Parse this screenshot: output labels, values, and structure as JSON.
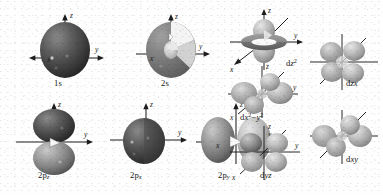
{
  "figure": {
    "background_color": "#fefefe",
    "ink_color": "#181818",
    "style": "grayscale shaded 3D renderings of hydrogen-like atomic orbitals with cartesian axis arrows"
  },
  "axis_labels": {
    "x": "x",
    "y": "y",
    "z": "z"
  },
  "orbitals": [
    {
      "id": "1s",
      "label_plain": "1s",
      "label_html": "1s",
      "shape": "sphere",
      "shade": "dark",
      "axes": [
        "z",
        "y",
        "x"
      ],
      "label_pos": "below"
    },
    {
      "id": "2s",
      "label_plain": "2s",
      "label_html": "2s",
      "shape": "cutaway-sphere-with-inner-node",
      "shade": "medium",
      "axes": [
        "z",
        "y",
        "x"
      ],
      "label_pos": "below"
    },
    {
      "id": "dz2",
      "label_plain": "dz2",
      "label_html": "d<span class='it'>z</span><span class='sup'>2</span>",
      "shape": "two-vertical-lobes-with-torus",
      "shade": "light",
      "axes": [
        "z",
        "y",
        "x"
      ],
      "label_pos": "right"
    },
    {
      "id": "2pz",
      "label_plain": "2pz",
      "label_html": "2p<span class='sub'>z</span>",
      "shape": "vertical-dumbbell",
      "shade": "dark",
      "axes": [
        "z",
        "y"
      ],
      "label_pos": "below"
    },
    {
      "id": "2px",
      "label_plain": "2px",
      "label_html": "2p<span class='sub'>x</span>",
      "shape": "dumbbell-along-viewer-axis",
      "shade": "dark",
      "axes": [
        "z",
        "y"
      ],
      "label_pos": "below"
    },
    {
      "id": "2py",
      "label_plain": "2py",
      "label_html": "2p<span class='sub'>y</span>",
      "shape": "horizontal-dumbbell",
      "shade": "medium",
      "axes": [
        "z",
        "y",
        "x"
      ],
      "label_pos": "below"
    },
    {
      "id": "dx2-y2",
      "label_plain": "dx2-y2",
      "label_html": "d<span class='it'>x</span><span class='sup'>2</span>&#8722;<span class='it'>y</span><span class='sup'>2</span>",
      "shape": "four-lobe-cloverleaf-on-axes",
      "shade": "light",
      "axes": [
        "z",
        "y",
        "x"
      ],
      "label_pos": "below"
    },
    {
      "id": "dyz",
      "label_plain": "dyz",
      "label_html": "d<span class='it'>yz</span>",
      "shape": "four-lobe-cloverleaf-between-axes",
      "shade": "medium",
      "axes": [
        "z",
        "y",
        "x"
      ],
      "label_pos": "below"
    },
    {
      "id": "dzx",
      "label_plain": "dzx",
      "label_html": "d<span class='it'>zx</span>",
      "shape": "four-lobe-cloverleaf-vertical",
      "shade": "light",
      "axes": [
        "z",
        "y",
        "x"
      ],
      "label_pos": "below-right"
    },
    {
      "id": "dxy",
      "label_plain": "dxy",
      "label_html": "d<span class='it'>xy</span>",
      "shape": "four-lobe-cloverleaf-horizontal",
      "shade": "light",
      "axes": [
        "z",
        "y",
        "x"
      ],
      "label_pos": "below-right"
    }
  ]
}
